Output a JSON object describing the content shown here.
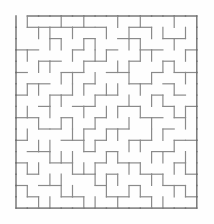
{
  "page": {
    "type": "maze",
    "background_color": "#fefefe"
  },
  "maze": {
    "name": "square-grid-maze",
    "wall_color": "#8a8a8a",
    "border_color": "#6f6f6f",
    "wall_thickness": 1.2,
    "border_thickness": 1.4,
    "cols": 16,
    "rows": 17,
    "cell_size": 11.3,
    "origin_x": 16,
    "origin_y": 16,
    "entrance": {
      "side": "top",
      "col": 0,
      "label": "start"
    },
    "exit": {
      "side": "right",
      "row": 8,
      "label": "finish"
    },
    "h_walls": [
      [
        1,
        1,
        1,
        1,
        1,
        1,
        1,
        1,
        1,
        1,
        1,
        1,
        1,
        1,
        1,
        1
      ],
      [
        0,
        1,
        1,
        1,
        1,
        1,
        1,
        1,
        0,
        0,
        1,
        1,
        0,
        0,
        0,
        0
      ],
      [
        0,
        0,
        0,
        1,
        0,
        0,
        1,
        0,
        0,
        1,
        1,
        0,
        0,
        1,
        1,
        0
      ],
      [
        1,
        1,
        0,
        0,
        0,
        1,
        0,
        0,
        1,
        0,
        0,
        1,
        1,
        0,
        0,
        1
      ],
      [
        0,
        0,
        1,
        1,
        0,
        0,
        1,
        1,
        0,
        0,
        1,
        0,
        0,
        1,
        0,
        0
      ],
      [
        1,
        0,
        0,
        0,
        1,
        1,
        0,
        0,
        1,
        1,
        0,
        0,
        1,
        0,
        1,
        1
      ],
      [
        0,
        1,
        1,
        0,
        0,
        0,
        1,
        0,
        0,
        0,
        1,
        1,
        0,
        1,
        0,
        0
      ],
      [
        1,
        0,
        0,
        1,
        1,
        0,
        0,
        1,
        1,
        0,
        0,
        0,
        1,
        0,
        1,
        0
      ],
      [
        0,
        0,
        1,
        0,
        0,
        1,
        1,
        0,
        0,
        1,
        1,
        0,
        0,
        1,
        0,
        1
      ],
      [
        1,
        1,
        0,
        0,
        1,
        0,
        0,
        1,
        0,
        0,
        0,
        1,
        1,
        0,
        1,
        0
      ],
      [
        0,
        0,
        1,
        1,
        0,
        0,
        1,
        0,
        1,
        1,
        0,
        0,
        0,
        1,
        0,
        0
      ],
      [
        1,
        0,
        0,
        0,
        1,
        1,
        0,
        1,
        0,
        0,
        1,
        1,
        0,
        0,
        1,
        1
      ],
      [
        0,
        1,
        1,
        0,
        0,
        0,
        1,
        0,
        1,
        0,
        0,
        0,
        1,
        1,
        0,
        0
      ],
      [
        1,
        0,
        0,
        1,
        1,
        0,
        0,
        1,
        0,
        1,
        1,
        0,
        0,
        0,
        1,
        0
      ],
      [
        0,
        1,
        0,
        0,
        0,
        1,
        1,
        0,
        1,
        0,
        0,
        1,
        1,
        0,
        0,
        1
      ],
      [
        1,
        0,
        1,
        1,
        0,
        0,
        0,
        1,
        0,
        0,
        1,
        0,
        0,
        1,
        1,
        0
      ],
      [
        0,
        1,
        0,
        0,
        1,
        1,
        0,
        0,
        1,
        1,
        0,
        1,
        0,
        0,
        0,
        1
      ],
      [
        1,
        1,
        1,
        1,
        1,
        1,
        1,
        1,
        1,
        1,
        1,
        1,
        1,
        1,
        1,
        1
      ]
    ],
    "v_walls": [
      [
        1,
        1,
        0,
        0,
        1,
        0,
        1,
        0,
        0,
        1,
        0,
        1,
        0,
        0,
        1,
        0,
        1
      ],
      [
        1,
        0,
        1,
        1,
        0,
        1,
        0,
        0,
        1,
        0,
        1,
        0,
        1,
        1,
        0,
        1,
        1
      ],
      [
        1,
        0,
        0,
        1,
        1,
        0,
        1,
        1,
        0,
        0,
        1,
        1,
        0,
        0,
        1,
        0,
        1
      ],
      [
        1,
        1,
        0,
        0,
        0,
        1,
        0,
        1,
        1,
        0,
        0,
        1,
        1,
        0,
        0,
        1,
        1
      ],
      [
        1,
        0,
        1,
        1,
        0,
        0,
        1,
        0,
        0,
        1,
        1,
        0,
        0,
        1,
        1,
        0,
        1
      ],
      [
        1,
        0,
        0,
        0,
        1,
        1,
        0,
        1,
        0,
        0,
        1,
        0,
        1,
        0,
        0,
        1,
        1
      ],
      [
        1,
        1,
        1,
        0,
        0,
        1,
        1,
        0,
        1,
        1,
        0,
        1,
        0,
        0,
        1,
        0,
        1
      ],
      [
        1,
        0,
        0,
        1,
        1,
        0,
        0,
        1,
        0,
        0,
        1,
        0,
        1,
        1,
        0,
        0,
        1
      ],
      [
        1,
        1,
        0,
        1,
        0,
        0,
        1,
        0,
        1,
        1,
        0,
        1,
        0,
        0,
        1,
        1,
        1
      ],
      [
        1,
        0,
        1,
        0,
        1,
        1,
        0,
        1,
        0,
        0,
        1,
        0,
        1,
        0,
        0,
        1,
        1
      ],
      [
        1,
        1,
        0,
        0,
        0,
        1,
        1,
        0,
        1,
        1,
        0,
        0,
        1,
        1,
        0,
        0,
        1
      ],
      [
        1,
        0,
        1,
        1,
        0,
        0,
        1,
        1,
        0,
        0,
        1,
        1,
        0,
        0,
        1,
        0,
        1
      ],
      [
        1,
        0,
        0,
        1,
        1,
        1,
        0,
        0,
        1,
        1,
        0,
        0,
        1,
        1,
        0,
        1,
        1
      ],
      [
        1,
        1,
        1,
        0,
        0,
        1,
        1,
        1,
        0,
        0,
        1,
        1,
        0,
        0,
        1,
        1,
        1
      ],
      [
        1,
        0,
        0,
        1,
        1,
        0,
        0,
        1,
        1,
        1,
        0,
        0,
        1,
        1,
        0,
        0,
        1
      ],
      [
        1,
        1,
        0,
        0,
        1,
        1,
        0,
        0,
        1,
        0,
        1,
        1,
        0,
        0,
        1,
        1,
        1
      ],
      [
        1,
        0,
        1,
        1,
        0,
        0,
        1,
        1,
        0,
        1,
        0,
        0,
        1,
        1,
        0,
        0,
        1
      ]
    ]
  }
}
